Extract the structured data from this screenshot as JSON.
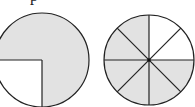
{
  "top_text_fragment": "p",
  "colors": {
    "shade": "#e2e2e2",
    "stroke": "#222222",
    "background": "#ffffff"
  },
  "figures": [
    {
      "name": "circle-quarters",
      "cx": 42,
      "cy": 60,
      "r": 47,
      "divisions": 4,
      "shaded_parts": 3,
      "unshaded_region": "bottom-left quadrant",
      "fraction_shaded": "3/4"
    },
    {
      "name": "circle-eighths",
      "cx": 149,
      "cy": 60,
      "r": 45,
      "divisions": 8,
      "shaded_parts": 6,
      "unshaded_region": "two top-right eighths (12 to 3 o'clock)",
      "fraction_shaded": "6/8"
    }
  ]
}
